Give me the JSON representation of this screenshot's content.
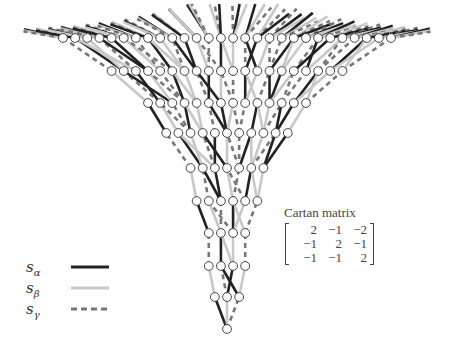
{
  "diagram": {
    "type": "Bruhat-like graph of affine Weyl group elements",
    "rows_node_counts_bottom_to_top": [
      1,
      3,
      4,
      4,
      6,
      7,
      11,
      14,
      20,
      28
    ],
    "node_color": "#ffffff",
    "node_stroke": "#444444"
  },
  "legend": {
    "items": [
      {
        "symbol": "s",
        "subscript": "α",
        "style": "solid-dark",
        "color": "#222222"
      },
      {
        "symbol": "s",
        "subscript": "β",
        "style": "solid-light",
        "color": "#c8c8c8"
      },
      {
        "symbol": "s",
        "subscript": "γ",
        "style": "dashed",
        "color": "#777777"
      }
    ]
  },
  "cartan": {
    "title": "Cartan matrix",
    "rows": [
      [
        "2",
        "−1",
        "−2"
      ],
      [
        "−1",
        "2",
        "−1"
      ],
      [
        "−1",
        "−1",
        "2"
      ]
    ]
  }
}
